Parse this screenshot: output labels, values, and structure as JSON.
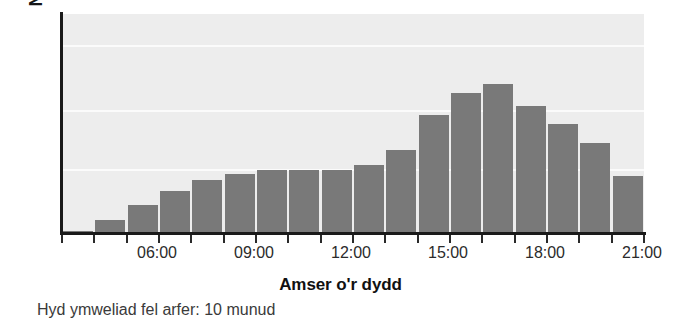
{
  "chart_data": {
    "type": "bar",
    "title": "",
    "xlabel": "Amser o'r dydd",
    "ylabel": "Nifer yr ymwelwyr",
    "caption": "Hyd ymweliad fel arfer: 10 munud",
    "grid": true,
    "legend": "none",
    "bar_color": "#797979",
    "plot_background": "#ededed",
    "gridline_color": "#fbfbfb",
    "axis_color": "#1a1a1a",
    "xlim": [
      "05:00",
      "23:00"
    ],
    "ylim": [
      0,
      100
    ],
    "categories": [
      "05:00",
      "06:00",
      "07:00",
      "08:00",
      "09:00",
      "10:00",
      "11:00",
      "12:00",
      "13:00",
      "14:00",
      "15:00",
      "16:00",
      "17:00",
      "18:00",
      "19:00",
      "20:00",
      "21:00",
      "22:00"
    ],
    "values": [
      1,
      6,
      13,
      19,
      24,
      27,
      29,
      29,
      29,
      31,
      38,
      54,
      64,
      68,
      58,
      50,
      41,
      26
    ],
    "tick_labels": [
      "06:00",
      "09:00",
      "12:00",
      "15:00",
      "18:00",
      "21:00"
    ],
    "tick_positions_px": [
      95,
      192,
      289,
      386,
      483,
      580
    ],
    "gridline_positions_pct": [
      14,
      44,
      71
    ],
    "n_ticks": 19
  }
}
